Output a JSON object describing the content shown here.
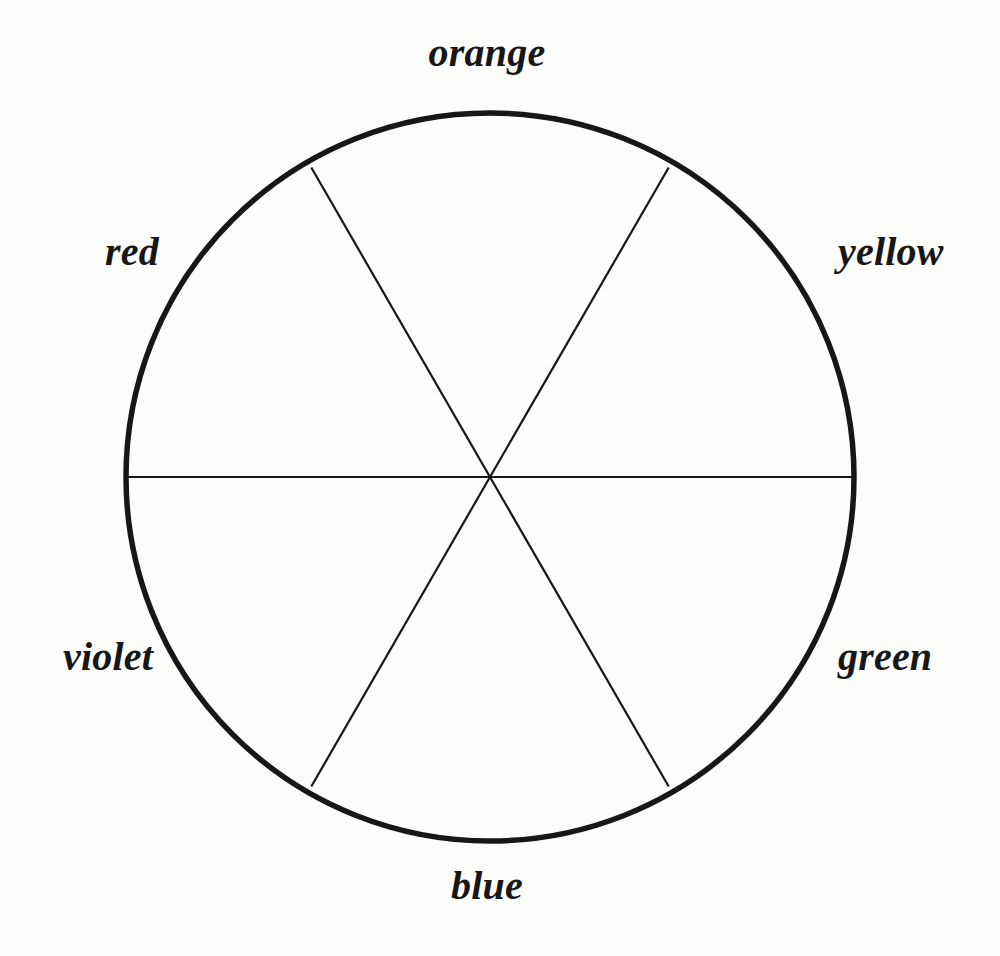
{
  "figure": {
    "kind": "color-wheel-diagram",
    "background_color": "#fdfdfc",
    "stroke_color": "#171717",
    "circle": {
      "center_x": 490,
      "center_y": 477,
      "radius": 364,
      "outline_width": 5.5,
      "spoke_width": 2.2
    }
  },
  "chart_data": {
    "type": "pie",
    "title": "",
    "xlabel": "",
    "ylabel": "",
    "legend_position": "around-perimeter",
    "grid": false,
    "categories": [
      "orange",
      "yellow",
      "green",
      "blue",
      "violet",
      "red"
    ],
    "values": [
      1,
      1,
      1,
      1,
      1,
      1
    ],
    "slice_degrees": [
      60,
      60,
      60,
      60,
      60,
      60
    ],
    "slice_fraction_percent": [
      16.7,
      16.7,
      16.7,
      16.7,
      16.7,
      16.7
    ],
    "sector_center_angles_deg": [
      90,
      30,
      330,
      270,
      210,
      150
    ],
    "divider_angles_deg": [
      0,
      60,
      120,
      180,
      240,
      300
    ],
    "slice_fill": "none",
    "annotations": []
  },
  "labels": {
    "orange": "orange",
    "yellow": "yellow",
    "green": "green",
    "blue": "blue",
    "violet": "violet",
    "red": "red"
  }
}
